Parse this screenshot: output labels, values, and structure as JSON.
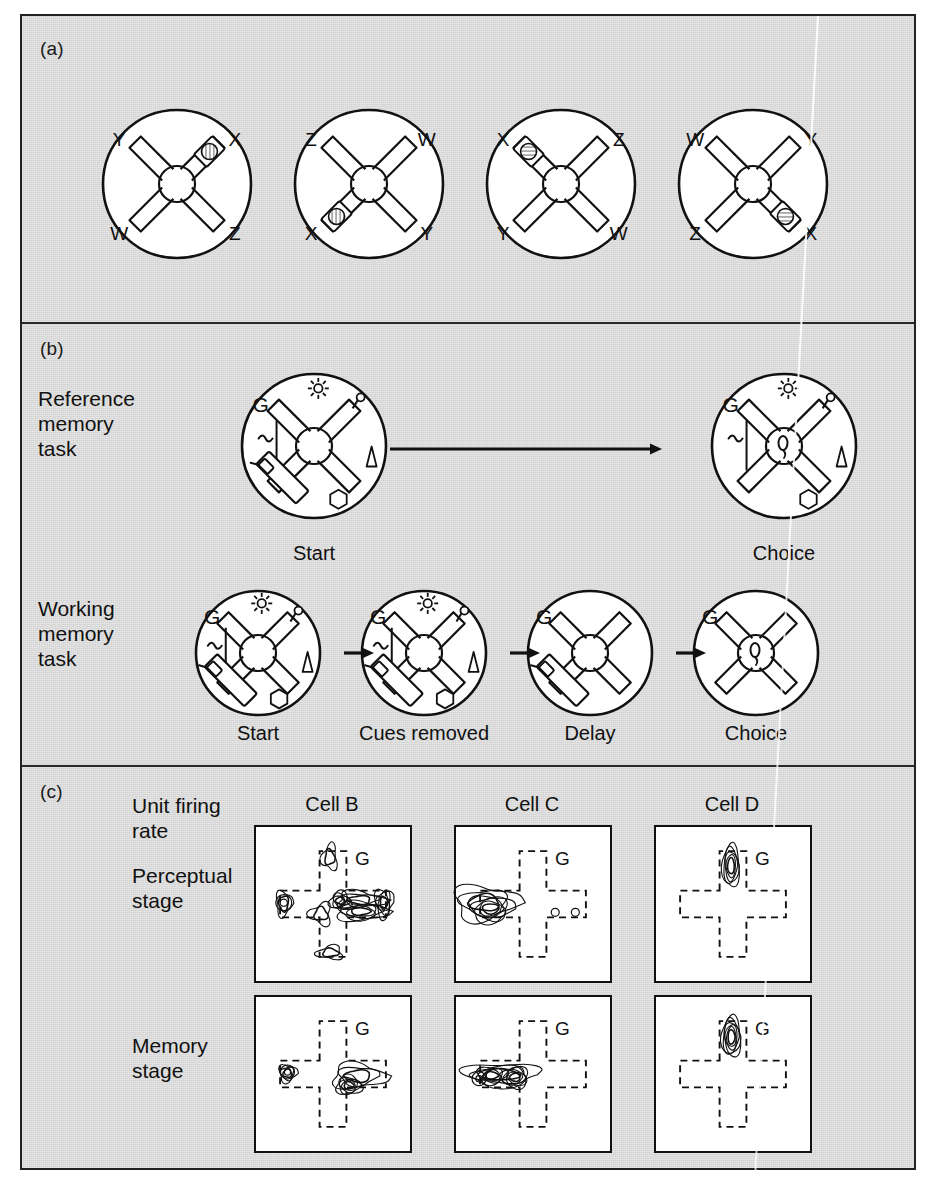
{
  "figure": {
    "background_color": "#d9d9d9",
    "ink_color": "#111111",
    "maze_fill": "#ffffff"
  },
  "panels": [
    {
      "tag": "(a)"
    },
    {
      "tag": "(b)"
    },
    {
      "tag": "(c)"
    }
  ],
  "panel_a": {
    "tag": "(a)",
    "description": "Four cross-maze configurations with rotated arm labels and a baited arm",
    "mazes": [
      {
        "id": "maze-a1",
        "arm_labels": {
          "top_left": "Y",
          "top_right": "X",
          "bottom_left": "W",
          "bottom_right": "Z"
        },
        "baited_arm": "top_right"
      },
      {
        "id": "maze-a2",
        "arm_labels": {
          "top_left": "Z",
          "top_right": "W",
          "bottom_left": "X",
          "bottom_right": "Y"
        },
        "baited_arm": "bottom_left"
      },
      {
        "id": "maze-a3",
        "arm_labels": {
          "top_left": "X",
          "top_right": "Z",
          "bottom_left": "Y",
          "bottom_right": "W"
        },
        "baited_arm": "top_left"
      },
      {
        "id": "maze-a4",
        "arm_labels": {
          "top_left": "W",
          "top_right": "Y",
          "bottom_left": "Z",
          "bottom_right": "X"
        },
        "baited_arm": "bottom_right"
      }
    ]
  },
  "panel_b": {
    "tag": "(b)",
    "rows": [
      {
        "id": "reference-memory",
        "label": "Reference\nmemory\ntask",
        "label_lines": [
          "Reference",
          "memory",
          "task"
        ],
        "stages": [
          {
            "id": "ref-start",
            "caption": "Start",
            "goal_label": "G",
            "cues_visible": true,
            "rat_position": "bottom-left-arm"
          },
          {
            "id": "ref-choice",
            "caption": "Choice",
            "goal_label": "G",
            "cues_visible": true,
            "rat_position": "center"
          }
        ],
        "connector": "long-arrow"
      },
      {
        "id": "working-memory",
        "label": "Working\nmemory\ntask",
        "label_lines": [
          "Working",
          "memory",
          "task"
        ],
        "stages": [
          {
            "id": "wm-start",
            "caption": "Start",
            "goal_label": "G",
            "cues_visible": true,
            "rat_position": "bottom-left-arm"
          },
          {
            "id": "wm-cues",
            "caption": "Cues removed",
            "goal_label": "G",
            "cues_visible": true,
            "rat_position": "bottom-left-arm"
          },
          {
            "id": "wm-delay",
            "caption": "Delay",
            "goal_label": "G",
            "cues_visible": false,
            "rat_position": "bottom-left-arm"
          },
          {
            "id": "wm-choice",
            "caption": "Choice",
            "goal_label": "G",
            "cues_visible": false,
            "rat_position": "center"
          }
        ],
        "connector": "short-arrow"
      }
    ],
    "cue_symbols": [
      "sun-light",
      "lollipop-circle",
      "triangle",
      "hexagon",
      "vertical-line-squiggle"
    ]
  },
  "panel_c": {
    "tag": "(c)",
    "row_labels": [
      {
        "id": "unit-firing-rate",
        "lines": [
          "Unit firing",
          "rate"
        ]
      },
      {
        "id": "perceptual-stage",
        "lines": [
          "Perceptual",
          "stage"
        ]
      },
      {
        "id": "memory-stage",
        "lines": [
          "Memory",
          "stage"
        ]
      }
    ],
    "column_headers": [
      "Cell B",
      "Cell C",
      "Cell D"
    ],
    "goal_label": "G",
    "plots": [
      {
        "id": "plot-b-perceptual",
        "cell": "Cell B",
        "stage": "Perceptual stage",
        "hotspots": "right arm near choice point and along east arm; minor foci on north, west and south arm ends"
      },
      {
        "id": "plot-c-perceptual",
        "cell": "Cell C",
        "stage": "Perceptual stage",
        "hotspots": "west arm end, large multi-ring focus; small rings on east arm"
      },
      {
        "id": "plot-d-perceptual",
        "cell": "Cell D",
        "stage": "Perceptual stage",
        "hotspots": "single tight focus in the north (goal) arm"
      },
      {
        "id": "plot-b-memory",
        "cell": "Cell B",
        "stage": "Memory stage",
        "hotspots": "focus below east arm near choice point; small ring at west arm end"
      },
      {
        "id": "plot-c-memory",
        "cell": "Cell C",
        "stage": "Memory stage",
        "hotspots": "elongated band along the entire west arm"
      },
      {
        "id": "plot-d-memory",
        "cell": "Cell D",
        "stage": "Memory stage",
        "hotspots": "single tight focus in the north (goal) arm"
      }
    ]
  }
}
